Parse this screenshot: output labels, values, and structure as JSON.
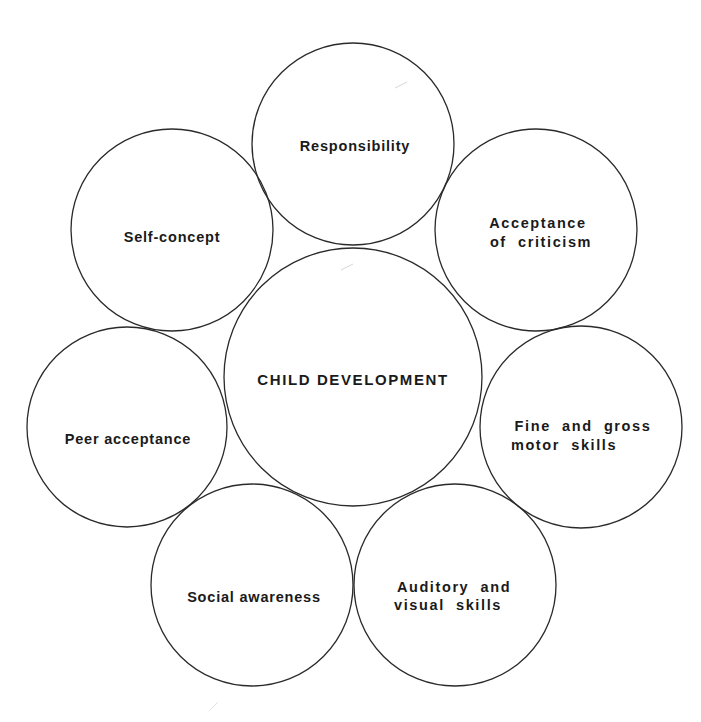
{
  "diagram": {
    "type": "hub-and-spoke circle diagram",
    "center": {
      "label": "CHILD DEVELOPMENT",
      "cx": 353,
      "cy": 377,
      "r": 129
    },
    "nodes": [
      {
        "id": "responsibility",
        "lines": [
          "Responsibility"
        ],
        "cx": 353,
        "cy": 144,
        "r": 101
      },
      {
        "id": "acceptance-of-criticism",
        "lines": [
          "Acceptance",
          "of  criticism"
        ],
        "cx": 536,
        "cy": 230,
        "r": 101
      },
      {
        "id": "fine-and-gross-motor-skills",
        "lines": [
          "Fine  and  gross",
          "motor  skills"
        ],
        "cx": 581,
        "cy": 427,
        "r": 101
      },
      {
        "id": "auditory-and-visual-skills",
        "lines": [
          "Auditory  and",
          "visual  skills"
        ],
        "cx": 455,
        "cy": 585,
        "r": 101
      },
      {
        "id": "social-awareness",
        "lines": [
          "Social awareness"
        ],
        "cx": 252,
        "cy": 585,
        "r": 101
      },
      {
        "id": "peer-acceptance",
        "lines": [
          "Peer acceptance"
        ],
        "cx": 127,
        "cy": 427,
        "r": 100
      },
      {
        "id": "self-concept",
        "lines": [
          "Self-concept"
        ],
        "cx": 172,
        "cy": 230,
        "r": 101
      }
    ],
    "colors": {
      "background": "#ffffff",
      "stroke": "#2a2a2a",
      "text": "#1a1a1a"
    }
  }
}
